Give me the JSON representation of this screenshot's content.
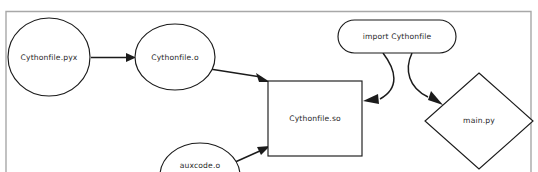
{
  "diagram": {
    "title_strip": {
      "text": "",
      "visible": false
    },
    "frame": {
      "color": "#a8a8a8",
      "x": 6,
      "y": 11,
      "width": 525,
      "height": 161
    },
    "palette": {
      "shape_stroke": "#1b1b1b",
      "shape_fill": "#ffffff",
      "edge": "#1b1b1b",
      "label_text": "#2a2a2a",
      "frame": "#a8a8a8",
      "background": "#ffffff"
    },
    "type": "flowchart",
    "nodes": [
      {
        "id": "cythonfile-pyx",
        "label": "Cythonfile.pyx",
        "shape": "ellipse",
        "cx": 49,
        "cy": 57,
        "rx": 41,
        "ry": 39
      },
      {
        "id": "cythonfile-o",
        "label": "Cythonfile.o",
        "shape": "ellipse",
        "cx": 175,
        "cy": 57,
        "rx": 40,
        "ry": 33
      },
      {
        "id": "auxcode-o",
        "label": "auxcode.o",
        "shape": "ellipse",
        "cx": 200,
        "cy": 176,
        "rx": 40,
        "ry": 33
      },
      {
        "id": "cythonfile-so",
        "label": "Cythonfile.so",
        "shape": "rectangle",
        "x": 268,
        "y": 81,
        "width": 94,
        "height": 75
      },
      {
        "id": "import-cythonfile",
        "label": "import Cythonfile",
        "shape": "rounded-rectangle",
        "x": 338,
        "y": 20,
        "width": 118,
        "height": 33
      },
      {
        "id": "main-py",
        "label": "main.py",
        "shape": "diamond",
        "cx": 479,
        "cy": 121,
        "rx": 54,
        "ry": 48
      }
    ],
    "edges": [
      {
        "id": "pyx-to-o",
        "from": "cythonfile-pyx",
        "to": "cythonfile-o",
        "style": "straight"
      },
      {
        "id": "o-to-so",
        "from": "cythonfile-o",
        "to": "cythonfile-so",
        "style": "straight"
      },
      {
        "id": "aux-to-so",
        "from": "auxcode-o",
        "to": "cythonfile-so",
        "style": "straight"
      },
      {
        "id": "import-to-so",
        "from": "import-cythonfile",
        "to": "cythonfile-so",
        "style": "curved"
      },
      {
        "id": "import-to-main",
        "from": "import-cythonfile",
        "to": "main-py",
        "style": "curved"
      }
    ]
  }
}
